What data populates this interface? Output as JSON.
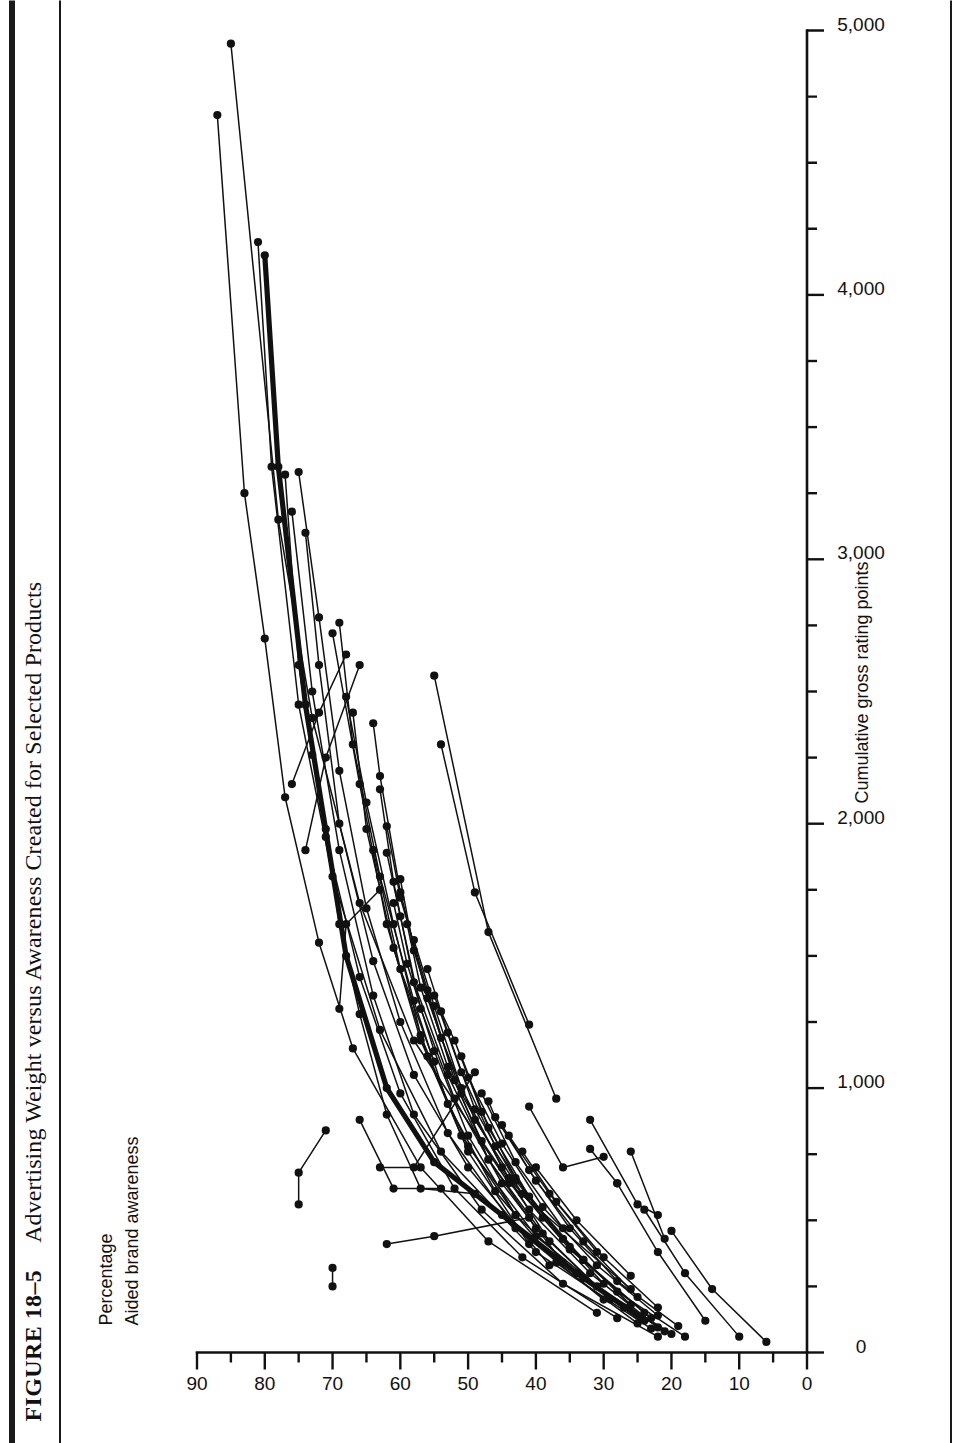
{
  "figure": {
    "number_label": "FIGURE 18–5",
    "title": "Advertising Weight versus Awareness Created for Selected Products"
  },
  "axes": {
    "y_caption_line1": "Percentage",
    "y_caption_line2": "Aided brand awareness",
    "x_caption": "Cumulative gross rating points",
    "y_ticks": [
      "90",
      "80",
      "70",
      "60",
      "50",
      "40",
      "30",
      "20",
      "10",
      "0"
    ],
    "x_ticks": [
      "0",
      "1,000",
      "2,000",
      "3,000",
      "4,000",
      "5,000"
    ]
  },
  "chart_data": {
    "type": "line",
    "title": "Advertising Weight versus Awareness Created for Selected Products",
    "xlabel": "Cumulative gross rating points",
    "ylabel": "Percentage Aided brand awareness",
    "xlim": [
      0,
      5000
    ],
    "ylim": [
      0,
      90
    ],
    "x_tick_step": 1000,
    "x_minor_tick_step": 250,
    "y_tick_step": 10,
    "y_minor_tick_step": 5,
    "grid": false,
    "legend": "none",
    "marker": "filled-circle",
    "line_color": "#111111",
    "orientation": "figure rotated 90 degrees counter-clockwise on the page",
    "series": [
      {
        "name": "brand-01",
        "emphasis": "heavy",
        "points": [
          [
            120,
            24
          ],
          [
            300,
            34
          ],
          [
            520,
            45
          ],
          [
            720,
            55
          ],
          [
            1000,
            62
          ],
          [
            1500,
            68
          ],
          [
            2450,
            74
          ],
          [
            3350,
            78
          ],
          [
            4150,
            80
          ]
        ]
      },
      {
        "name": "brand-02",
        "points": [
          [
            150,
            31
          ],
          [
            420,
            47
          ],
          [
            700,
            57
          ],
          [
            1150,
            67
          ],
          [
            1550,
            72
          ],
          [
            2100,
            77
          ],
          [
            2700,
            80
          ],
          [
            3250,
            83
          ],
          [
            4680,
            87
          ]
        ]
      },
      {
        "name": "brand-03",
        "points": [
          [
            240,
            26
          ],
          [
            640,
            44
          ],
          [
            1180,
            58
          ],
          [
            1700,
            66
          ],
          [
            2400,
            73
          ],
          [
            3150,
            78
          ],
          [
            4950,
            85
          ]
        ]
      },
      {
        "name": "brand-04",
        "points": [
          [
            90,
            23
          ],
          [
            380,
            40
          ],
          [
            760,
            54
          ],
          [
            1220,
            63
          ],
          [
            1800,
            70
          ],
          [
            2450,
            75
          ],
          [
            3350,
            79
          ],
          [
            4200,
            81
          ]
        ]
      },
      {
        "name": "brand-05",
        "points": [
          [
            130,
            28
          ],
          [
            360,
            42
          ],
          [
            620,
            52
          ],
          [
            980,
            60
          ],
          [
            1420,
            66
          ],
          [
            1950,
            71
          ],
          [
            2600,
            75
          ],
          [
            3320,
            77
          ]
        ]
      },
      {
        "name": "brand-06",
        "points": [
          [
            200,
            30
          ],
          [
            470,
            43
          ],
          [
            830,
            53
          ],
          [
            1250,
            60
          ],
          [
            1680,
            65
          ],
          [
            2200,
            69
          ],
          [
            2780,
            72
          ],
          [
            3330,
            75
          ]
        ]
      },
      {
        "name": "brand-07",
        "points": [
          [
            60,
            22
          ],
          [
            260,
            36
          ],
          [
            540,
            48
          ],
          [
            900,
            58
          ],
          [
            1350,
            64
          ],
          [
            1900,
            69
          ],
          [
            2500,
            73
          ],
          [
            3180,
            76
          ]
        ]
      },
      {
        "name": "brand-08",
        "points": [
          [
            330,
            38
          ],
          [
            700,
            50
          ],
          [
            1050,
            58
          ],
          [
            1480,
            64
          ],
          [
            2000,
            69
          ],
          [
            2600,
            72
          ],
          [
            3100,
            74
          ]
        ]
      },
      {
        "name": "brand-09",
        "points": [
          [
            170,
            27
          ],
          [
            440,
            40
          ],
          [
            780,
            50
          ],
          [
            1180,
            57
          ],
          [
            1620,
            62
          ],
          [
            2150,
            66
          ],
          [
            2720,
            70
          ]
        ]
      },
      {
        "name": "brand-10",
        "points": [
          [
            110,
            25
          ],
          [
            340,
            37
          ],
          [
            610,
            46
          ],
          [
            940,
            53
          ],
          [
            1330,
            58
          ],
          [
            1800,
            63
          ],
          [
            2300,
            67
          ],
          [
            2760,
            69
          ]
        ]
      },
      {
        "name": "brand-11",
        "points": [
          [
            80,
            21
          ],
          [
            280,
            33
          ],
          [
            520,
            43
          ],
          [
            820,
            51
          ],
          [
            1200,
            57
          ],
          [
            1620,
            61
          ],
          [
            2080,
            65
          ],
          [
            2480,
            68
          ]
        ]
      },
      {
        "name": "brand-12",
        "points": [
          [
            410,
            41
          ],
          [
            760,
            50
          ],
          [
            1120,
            56
          ],
          [
            1530,
            61
          ],
          [
            1980,
            65
          ],
          [
            2420,
            67
          ]
        ]
      },
      {
        "name": "brand-13",
        "points": [
          [
            150,
            24
          ],
          [
            390,
            35
          ],
          [
            660,
            44
          ],
          [
            980,
            51
          ],
          [
            1340,
            56
          ],
          [
            1740,
            60
          ],
          [
            2180,
            63
          ],
          [
            2380,
            64
          ]
        ]
      },
      {
        "name": "brand-14",
        "points": [
          [
            600,
            49
          ],
          [
            620,
            57
          ],
          [
            900,
            62
          ],
          [
            1280,
            66
          ],
          [
            1620,
            69
          ],
          [
            1980,
            71
          ],
          [
            2260,
            73
          ]
        ]
      },
      {
        "name": "brand-15",
        "points": [
          [
            200,
            29
          ],
          [
            450,
            39
          ],
          [
            730,
            47
          ],
          [
            1050,
            53
          ],
          [
            1400,
            58
          ],
          [
            1780,
            61
          ],
          [
            2130,
            63
          ]
        ]
      },
      {
        "name": "brand-16",
        "points": [
          [
            70,
            20
          ],
          [
            250,
            31
          ],
          [
            470,
            40
          ],
          [
            730,
            47
          ],
          [
            1030,
            52
          ],
          [
            1370,
            56
          ],
          [
            1720,
            60
          ],
          [
            1990,
            62
          ]
        ]
      },
      {
        "name": "brand-17",
        "points": [
          [
            340,
            36
          ],
          [
            640,
            45
          ],
          [
            960,
            52
          ],
          [
            1300,
            57
          ],
          [
            1650,
            60
          ],
          [
            1890,
            62
          ]
        ]
      },
      {
        "name": "brand-18",
        "points": [
          [
            130,
            23
          ],
          [
            350,
            33
          ],
          [
            600,
            42
          ],
          [
            880,
            49
          ],
          [
            1190,
            54
          ],
          [
            1520,
            58
          ],
          [
            1790,
            60
          ]
        ]
      },
      {
        "name": "brand-19",
        "points": [
          [
            520,
            43
          ],
          [
            820,
            50
          ],
          [
            1140,
            55
          ],
          [
            1470,
            59
          ],
          [
            1700,
            61
          ]
        ]
      },
      {
        "name": "brand-20",
        "points": [
          [
            95,
            22
          ],
          [
            300,
            32
          ],
          [
            540,
            41
          ],
          [
            800,
            48
          ],
          [
            1080,
            53
          ],
          [
            1380,
            57
          ],
          [
            1620,
            59
          ]
        ]
      },
      {
        "name": "brand-21",
        "points": [
          [
            420,
            38
          ],
          [
            700,
            45
          ],
          [
            1000,
            51
          ],
          [
            1310,
            55
          ],
          [
            1560,
            58
          ]
        ]
      },
      {
        "name": "brand-22",
        "points": [
          [
            180,
            26
          ],
          [
            400,
            35
          ],
          [
            650,
            43
          ],
          [
            920,
            49
          ],
          [
            1210,
            53
          ],
          [
            1450,
            56
          ]
        ]
      },
      {
        "name": "brand-23",
        "points": [
          [
            260,
            30
          ],
          [
            510,
            39
          ],
          [
            780,
            46
          ],
          [
            1060,
            51
          ],
          [
            1350,
            55
          ]
        ]
      },
      {
        "name": "brand-24",
        "points": [
          [
            60,
            18
          ],
          [
            230,
            28
          ],
          [
            430,
            36
          ],
          [
            660,
            43
          ],
          [
            910,
            48
          ],
          [
            1180,
            52
          ],
          [
            1290,
            54
          ]
        ]
      },
      {
        "name": "brand-25",
        "points": [
          [
            350,
            33
          ],
          [
            590,
            41
          ],
          [
            850,
            47
          ],
          [
            1120,
            51
          ]
        ]
      },
      {
        "name": "brand-26",
        "points": [
          [
            140,
            22
          ],
          [
            330,
            31
          ],
          [
            550,
            39
          ],
          [
            790,
            45
          ],
          [
            1040,
            50
          ]
        ]
      },
      {
        "name": "brand-27",
        "points": [
          [
            470,
            36
          ],
          [
            720,
            43
          ],
          [
            980,
            48
          ]
        ]
      },
      {
        "name": "brand-28",
        "points": [
          [
            210,
            25
          ],
          [
            420,
            33
          ],
          [
            650,
            40
          ],
          [
            890,
            46
          ],
          [
            950,
            47
          ]
        ]
      },
      {
        "name": "brand-29",
        "points": [
          [
            100,
            19
          ],
          [
            270,
            28
          ],
          [
            470,
            35
          ],
          [
            690,
            41
          ],
          [
            860,
            45
          ]
        ]
      },
      {
        "name": "brand-30",
        "points": [
          [
            380,
            31
          ],
          [
            600,
            38
          ],
          [
            820,
            44
          ]
        ]
      },
      {
        "name": "brand-31",
        "points": [
          [
            170,
            22
          ],
          [
            360,
            30
          ],
          [
            570,
            37
          ],
          [
            760,
            42
          ]
        ]
      },
      {
        "name": "brand-32",
        "points": [
          [
            290,
            26
          ],
          [
            500,
            34
          ],
          [
            700,
            40
          ]
        ]
      },
      {
        "name": "brand-33",
        "points": [
          [
            620,
            54
          ],
          [
            620,
            61
          ],
          [
            880,
            66
          ]
        ]
      },
      {
        "name": "brand-34",
        "points": [
          [
            560,
            75
          ],
          [
            680,
            75
          ],
          [
            840,
            71
          ]
        ]
      },
      {
        "name": "brand-35",
        "points": [
          [
            250,
            70
          ],
          [
            320,
            70
          ]
        ]
      },
      {
        "name": "brand-36",
        "points": [
          [
            960,
            37
          ],
          [
            1590,
            47
          ],
          [
            2560,
            55
          ]
        ]
      },
      {
        "name": "brand-37",
        "points": [
          [
            1240,
            41
          ],
          [
            1740,
            49
          ],
          [
            2300,
            54
          ]
        ]
      },
      {
        "name": "brand-38",
        "points": [
          [
            740,
            30
          ],
          [
            700,
            36
          ],
          [
            930,
            41
          ]
        ]
      },
      {
        "name": "brand-39",
        "points": [
          [
            640,
            28
          ],
          [
            770,
            32
          ]
        ]
      },
      {
        "name": "brand-40",
        "points": [
          [
            430,
            21
          ],
          [
            760,
            26
          ]
        ]
      },
      {
        "name": "brand-41",
        "points": [
          [
            120,
            15
          ],
          [
            380,
            22
          ],
          [
            640,
            28
          ]
        ]
      },
      {
        "name": "brand-42",
        "points": [
          [
            60,
            10
          ],
          [
            300,
            18
          ],
          [
            540,
            24
          ]
        ]
      },
      {
        "name": "brand-43",
        "points": [
          [
            40,
            6
          ],
          [
            240,
            14
          ],
          [
            460,
            20
          ]
        ]
      },
      {
        "name": "brand-44",
        "points": [
          [
            520,
            22
          ],
          [
            560,
            25
          ],
          [
            880,
            32
          ]
        ]
      },
      {
        "name": "brand-45",
        "points": [
          [
            1100,
            55
          ],
          [
            1450,
            60
          ],
          [
            1900,
            64
          ]
        ]
      },
      {
        "name": "brand-46",
        "points": [
          [
            700,
            63
          ],
          [
            700,
            58
          ],
          [
            1060,
            49
          ]
        ]
      },
      {
        "name": "brand-47",
        "points": [
          [
            410,
            62
          ],
          [
            440,
            55
          ],
          [
            510,
            41
          ]
        ]
      },
      {
        "name": "brand-48",
        "points": [
          [
            1300,
            69
          ],
          [
            1620,
            68
          ],
          [
            1750,
            63
          ]
        ]
      },
      {
        "name": "brand-49",
        "points": [
          [
            2150,
            76
          ],
          [
            2420,
            72
          ],
          [
            2640,
            68
          ]
        ]
      },
      {
        "name": "brand-50",
        "points": [
          [
            1900,
            74
          ],
          [
            2250,
            71
          ],
          [
            2600,
            66
          ]
        ]
      }
    ]
  }
}
